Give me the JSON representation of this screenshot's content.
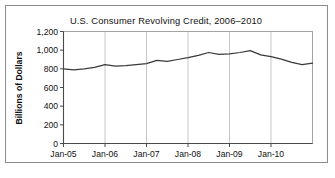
{
  "figure": {
    "border_color": "#8d8d8d",
    "background": "#ffffff"
  },
  "chart_data": {
    "type": "line",
    "title": "U.S. Consumer Revolving Credit, 2006–2010",
    "xlabel": "",
    "ylabel": "Billions of Dollars",
    "ylim": [
      0,
      1200
    ],
    "y_ticks": [
      0,
      200,
      400,
      600,
      800,
      1000,
      1200
    ],
    "y_tick_labels": [
      "0",
      "200",
      "400",
      "600",
      "800",
      "1,000",
      "1,200"
    ],
    "x_ticks": [
      "Jan-05",
      "Jan-06",
      "Jan-07",
      "Jan-08",
      "Jan-09",
      "Jan-10"
    ],
    "x_tick_labels": [
      "Jan-05",
      "Jan-06",
      "Jan-07",
      "Jan-08",
      "Jan-09",
      "Jan-10"
    ],
    "grid": "vertical",
    "legend": "none",
    "line_color": "#3a3a3a",
    "series": [
      {
        "name": "U.S. Consumer Revolving Credit",
        "x": [
          "Jan-05",
          "Apr-05",
          "Jul-05",
          "Oct-05",
          "Jan-06",
          "Apr-06",
          "Jul-06",
          "Oct-06",
          "Jan-07",
          "Apr-07",
          "Jul-07",
          "Oct-07",
          "Jan-08",
          "Apr-08",
          "Jul-08",
          "Oct-08",
          "Jan-09",
          "Apr-09",
          "Jul-09",
          "Oct-09",
          "Jan-10",
          "Apr-10",
          "Jul-10",
          "Oct-10",
          "Dec-10"
        ],
        "values": [
          800,
          790,
          800,
          815,
          845,
          830,
          835,
          845,
          855,
          890,
          880,
          900,
          920,
          945,
          975,
          955,
          960,
          975,
          995,
          950,
          930,
          905,
          870,
          845,
          860
        ]
      }
    ]
  }
}
